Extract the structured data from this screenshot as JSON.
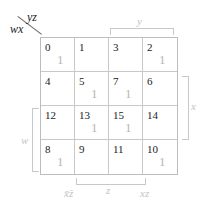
{
  "corner": {
    "row_vars": "wx",
    "col_vars": "yz"
  },
  "cells": [
    {
      "index": "0",
      "value": "1"
    },
    {
      "index": "1",
      "value": ""
    },
    {
      "index": "3",
      "value": ""
    },
    {
      "index": "2",
      "value": "1"
    },
    {
      "index": "4",
      "value": ""
    },
    {
      "index": "5",
      "value": "1"
    },
    {
      "index": "7",
      "value": "1"
    },
    {
      "index": "6",
      "value": ""
    },
    {
      "index": "12",
      "value": ""
    },
    {
      "index": "13",
      "value": "1"
    },
    {
      "index": "15",
      "value": "1"
    },
    {
      "index": "14",
      "value": ""
    },
    {
      "index": "8",
      "value": "1"
    },
    {
      "index": "9",
      "value": ""
    },
    {
      "index": "11",
      "value": ""
    },
    {
      "index": "10",
      "value": "1"
    }
  ],
  "brackets": {
    "top": "y",
    "right": "x",
    "left": "w",
    "bottom": "z"
  },
  "group_labels": {
    "bottom_left": "x̄z̄",
    "bottom_right": "xz"
  }
}
